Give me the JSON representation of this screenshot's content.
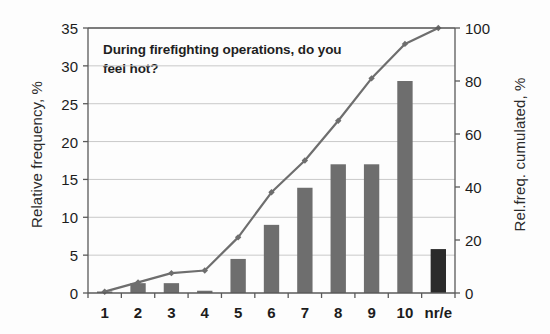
{
  "chart_data": {
    "type": "bar",
    "title": "During firefighting operations, do you feel hot?",
    "categories": [
      "1",
      "2",
      "3",
      "4",
      "5",
      "6",
      "7",
      "8",
      "9",
      "10",
      "nr/e"
    ],
    "xlabel": "",
    "ylabel": "Relative frequency, %",
    "ylabel_right": "Rel.freq. cumulated, %",
    "ylim": [
      0,
      35
    ],
    "ylim_right": [
      0,
      100
    ],
    "yticks": [
      0,
      5,
      10,
      15,
      20,
      25,
      30,
      35
    ],
    "yticks_right": [
      0,
      20,
      40,
      60,
      80,
      100
    ],
    "grid": true,
    "legend": "none",
    "series": [
      {
        "name": "Relative frequency, %",
        "type": "bar",
        "axis": "left",
        "color": "#6e6e6e",
        "last_bar_color": "#2b2b2b",
        "values": [
          0.2,
          1.3,
          1.3,
          0.3,
          4.5,
          9.0,
          13.9,
          17.0,
          17.0,
          28.0,
          5.8
        ]
      },
      {
        "name": "Rel.freq. cumulated, %",
        "type": "line",
        "axis": "right",
        "color": "#6e6e6e",
        "values": [
          0.5,
          4.0,
          7.5,
          8.5,
          21.0,
          38.0,
          50.0,
          65.0,
          81.0,
          94.0,
          100.0
        ]
      }
    ]
  },
  "axes": {
    "left_title": "Relative frequency, %",
    "right_title": "Rel.freq. cumulated, %",
    "left_ticks": [
      "0",
      "5",
      "10",
      "15",
      "20",
      "25",
      "30",
      "35"
    ],
    "right_ticks": [
      "0",
      "20",
      "40",
      "60",
      "80",
      "100"
    ],
    "x_ticks": [
      "1",
      "2",
      "3",
      "4",
      "5",
      "6",
      "7",
      "8",
      "9",
      "10",
      "nr/e"
    ]
  },
  "title": {
    "text": "During firefighting operations, do you feel hot?"
  },
  "colors": {
    "bar": "#6e6e6e",
    "bar_last": "#2b2b2b",
    "line": "#6e6e6e",
    "axis": "#5a5a5a",
    "grid": "#c9c9c9",
    "text": "#1c1c1c"
  }
}
